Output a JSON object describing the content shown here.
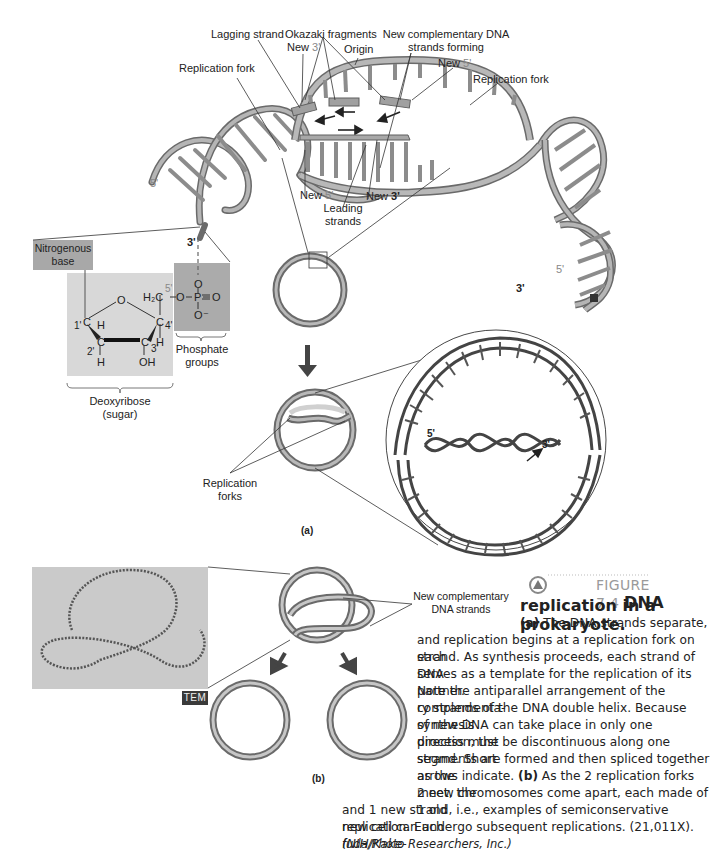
{
  "figure": {
    "number_label": "FIGURE 7.4",
    "title_bold_1": "DNA",
    "title_bold_2": "replication in a prokaryote.",
    "panel_a": "(a)",
    "panel_b": "(b)"
  },
  "helix_labels": {
    "lagging_strand": "Lagging strand",
    "okazaki_fragments": "Okazaki fragments",
    "new_complementary_forming_1": "New complementary DNA",
    "new_complementary_forming_2": "strands forming",
    "new_3_top": "New",
    "new_3_top_prime": "3'",
    "origin": "Origin",
    "new_5_top": "New",
    "new_5_top_prime": "5'",
    "replication_fork_left": "Replication fork",
    "replication_fork_right": "Replication fork",
    "new_5_bottom": "New",
    "new_5_bottom_prime": "5'",
    "new_3_bottom": "New",
    "new_3_bottom_prime": "3'",
    "leading_strands_1": "Leading",
    "leading_strands_2": "strands",
    "left_5": "5'",
    "left_3": "3'",
    "right_5": "5'",
    "right_3": "3'"
  },
  "chemistry": {
    "nitrogenous_base_1": "Nitrogenous",
    "nitrogenous_base_2": "base",
    "phosphate_groups_1": "Phosphate",
    "phosphate_groups_2": "groups",
    "deoxyribose_1": "Deoxyribose",
    "deoxyribose_2": "(sugar)",
    "atoms": {
      "O_ring": "O",
      "C1": "C",
      "C1_num": "1'",
      "H1": "H",
      "C2": "C",
      "C2_num": "2'",
      "H2": "H",
      "C3": "C",
      "C3_num": "3'",
      "OH": "OH",
      "C4": "C",
      "C4_num": "4'",
      "H4": "H",
      "C5_num": "5'",
      "H2C": "H₂C",
      "O_link": "O",
      "P": "P",
      "O_top": "O",
      "O_double": "O",
      "O_minus": "O⁻"
    }
  },
  "circle_labels": {
    "replication_forks_1": "Replication",
    "replication_forks_2": "forks",
    "inset_5": "5'",
    "inset_3": "3'"
  },
  "panel_b_labels": {
    "new_complementary_1": "New complementary",
    "new_complementary_2": "DNA strands",
    "tem": "TEM"
  },
  "caption": {
    "line1_bold": "(a)",
    "line1": " The DNA strands separate,",
    "line2": "and replication begins at a replication fork on each",
    "line3": "strand.  As synthesis proceeds, each strand of DNA",
    "line4": "serves as a template for the replication of its partner.",
    "line5": "Note the antiparallel arrangement of the complementa-",
    "line6": "ry strands of the DNA double helix. Because synthesis",
    "line7": "of new DNA can take place in only one direction, the",
    "line8": "process must be discontinuous along one strand. Short",
    "line9": "segments are formed and then spliced together as the",
    "line10a": "arrows indicate. ",
    "line10_bold": "(b)",
    "line10b": " As the 2 replication forks meet, the",
    "line11": "2 new chromosomes come apart, each made of 1 old",
    "line12": "and 1 new strand, i.e., examples of semiconservative replication. Each",
    "line13": "new cell can undergo subsequent replications. (21,011X). ",
    "line13_italic": "(NIH/Kake-",
    "line14_italic": "fuda/Photo Researchers, Inc.)"
  },
  "colors": {
    "strand_grey": "#8a8a8a",
    "strand_light": "#c4c4c4",
    "box_dark": "#a8a8a8",
    "box_light": "#d4d4d4",
    "tem_bg": "#c9c9c9"
  }
}
